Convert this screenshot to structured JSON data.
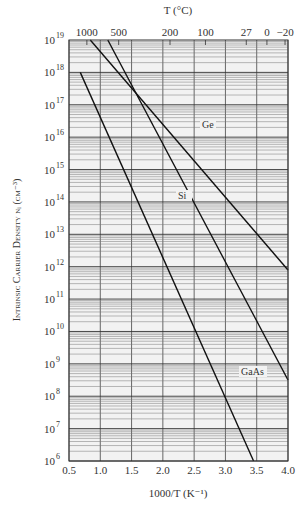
{
  "chart_data": {
    "type": "line",
    "title": "",
    "xlabel": "1000/T (K^-1)",
    "ylabel": "INTRINSIC CARRIER DENSITY n_i (cm^-3)",
    "top_axis_label": "T (°C)",
    "xlim": [
      0.5,
      4.0
    ],
    "ylim_log10": [
      6,
      19
    ],
    "y_scale": "log",
    "grid": true,
    "x_ticks": [
      "0.5",
      "1.0",
      "1.5",
      "2.0",
      "2.5",
      "3.0",
      "3.5",
      "4.0"
    ],
    "y_ticks": [
      "10^6",
      "10^7",
      "10^8",
      "10^9",
      "10^10",
      "10^11",
      "10^12",
      "10^13",
      "10^14",
      "10^15",
      "10^16",
      "10^17",
      "10^18",
      "10^19"
    ],
    "top_ticks": [
      {
        "label": "1000",
        "celsius": 1000
      },
      {
        "label": "500",
        "celsius": 500
      },
      {
        "label": "200",
        "celsius": 200
      },
      {
        "label": "100",
        "celsius": 100
      },
      {
        "label": "27",
        "celsius": 27
      },
      {
        "label": "0",
        "celsius": 0
      },
      {
        "label": "-20",
        "celsius": -20
      }
    ],
    "series": [
      {
        "name": "Ge",
        "x": [
          0.84,
          4.0
        ],
        "log10_y": [
          19.0,
          11.9
        ]
      },
      {
        "name": "Si",
        "x": [
          1.12,
          4.0
        ],
        "log10_y": [
          19.0,
          8.5
        ]
      },
      {
        "name": "GaAs",
        "x": [
          0.68,
          3.45
        ],
        "log10_y": [
          18.0,
          6.0
        ]
      }
    ],
    "legend": "inline labels on curves"
  }
}
